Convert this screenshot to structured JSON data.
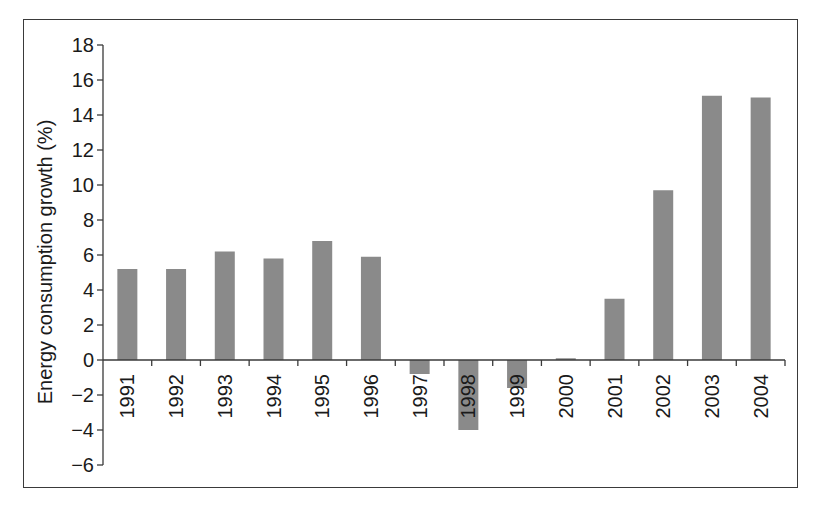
{
  "chart_data": {
    "type": "bar",
    "title": "",
    "xlabel": "",
    "ylabel": "Energy consumption growth (%)",
    "categories": [
      "1991",
      "1992",
      "1993",
      "1994",
      "1995",
      "1996",
      "1997",
      "1998",
      "1999",
      "2000",
      "2001",
      "2002",
      "2003",
      "2004"
    ],
    "values": [
      5.2,
      5.2,
      6.2,
      5.8,
      6.8,
      5.9,
      -0.8,
      -4.0,
      -1.6,
      0.1,
      3.5,
      9.7,
      15.1,
      15.0
    ],
    "ylim": [
      -6,
      18
    ],
    "yticks": [
      18,
      16,
      14,
      12,
      10,
      8,
      6,
      4,
      2,
      0,
      -2,
      -4,
      -6
    ],
    "ytick_labels": [
      "18",
      "16",
      "14",
      "12",
      "10",
      "8",
      "6",
      "4",
      "2",
      "0",
      "−2",
      "−4",
      "−6"
    ],
    "grid": false,
    "legend": null,
    "bar_color": "#8a8a8a",
    "axis_color": "#3a3a3a",
    "frame_color": "#3a3a3a"
  }
}
